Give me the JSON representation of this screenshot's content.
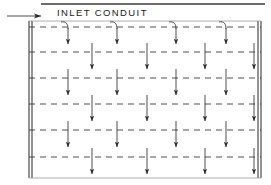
{
  "diagram": {
    "title_label": "INLET CONDUIT",
    "type": "plan-view-distribution-basin",
    "colors": {
      "line": "#3a3a3a",
      "text": "#1a1a1a",
      "background": "#ffffff"
    },
    "frame": {
      "outer_left": 29,
      "outer_right": 261,
      "outer_top": 21,
      "outer_bottom": 178,
      "wall_gap": 3,
      "top_solid_line_y": 4,
      "top_solid_line_x1": 41,
      "top_solid_line_x2": 265
    },
    "inlet_arrow": {
      "x1": 7,
      "x2": 41,
      "y": 16,
      "direction": "right"
    },
    "header_line": {
      "y": 27,
      "x1": 29,
      "x2": 261,
      "style": "dashed"
    },
    "lateral_lines": [
      {
        "y": 52,
        "style": "dashed"
      },
      {
        "y": 78,
        "style": "dashed"
      },
      {
        "y": 104,
        "style": "dashed"
      },
      {
        "y": 130,
        "style": "dashed"
      },
      {
        "y": 157,
        "style": "dashed"
      }
    ],
    "branch_columns_a": [
      68,
      117,
      176,
      226
    ],
    "branch_columns_b": [
      92,
      147,
      205,
      254
    ],
    "header_tees": [
      {
        "x": 68,
        "style": "curved-tee-down"
      },
      {
        "x": 117,
        "style": "curved-tee-down"
      },
      {
        "x": 176,
        "style": "curved-tee-down"
      },
      {
        "x": 226,
        "style": "curved-tee-down"
      }
    ],
    "drop_arrow_rows": [
      {
        "line_y": 27,
        "columns": "a",
        "arrow_end": 44
      },
      {
        "line_y": 52,
        "columns": "b",
        "arrow_end": 69
      },
      {
        "line_y": 78,
        "columns": "a",
        "arrow_end": 95
      },
      {
        "line_y": 104,
        "columns": "b",
        "arrow_end": 121
      },
      {
        "line_y": 130,
        "columns": "a",
        "arrow_end": 147
      },
      {
        "line_y": 157,
        "columns": "b",
        "arrow_end": 174
      }
    ],
    "tick_stub_length": 9
  }
}
